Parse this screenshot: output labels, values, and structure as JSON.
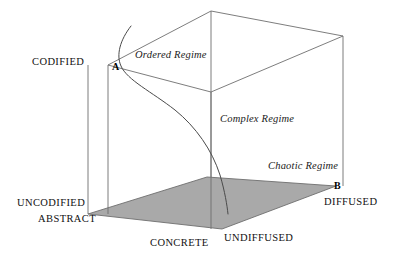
{
  "diagram": {
    "colors": {
      "line": "#6e6e6e",
      "floor_fill": "#a9a9a9",
      "floor_stroke": "#6e6e6e",
      "curve": "#4a4a4a",
      "text": "#111111",
      "background": "#ffffff"
    },
    "axis_labels": {
      "codified": "CODIFIED",
      "uncodified": "UNCODIFIED",
      "abstract": "ABSTRACT",
      "concrete": "CONCRETE",
      "undiffused": "UNDIFFUSED",
      "diffused": "DIFFUSED"
    },
    "vertex_labels": {
      "a": "A",
      "b": "B"
    },
    "regimes": [
      {
        "name": "ordered",
        "label": "Ordered Regime"
      },
      {
        "name": "complex",
        "label": "Complex Regime"
      },
      {
        "name": "chaotic",
        "label": "Chaotic Regime"
      }
    ]
  }
}
